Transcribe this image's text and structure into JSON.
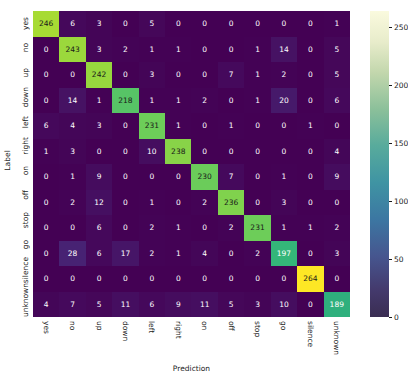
{
  "chart_data": {
    "type": "heatmap",
    "title": "",
    "xlabel": "Prediction",
    "ylabel": "Label",
    "categories": [
      "yes",
      "no",
      "up",
      "down",
      "left",
      "right",
      "on",
      "off",
      "stop",
      "go",
      "silence",
      "unknown"
    ],
    "row_labels": [
      "yes",
      "no",
      "up",
      "down",
      "left",
      "right",
      "on",
      "off",
      "stop",
      "go",
      "silence",
      "unknown"
    ],
    "col_labels": [
      "yes",
      "no",
      "up",
      "down",
      "left",
      "right",
      "on",
      "off",
      "stop",
      "go",
      "silence",
      "unknown"
    ],
    "values": [
      [
        246,
        6,
        3,
        0,
        5,
        0,
        0,
        0,
        0,
        0,
        0,
        1
      ],
      [
        0,
        243,
        3,
        2,
        1,
        1,
        0,
        0,
        1,
        14,
        0,
        5
      ],
      [
        0,
        0,
        242,
        0,
        3,
        0,
        0,
        7,
        1,
        2,
        0,
        5
      ],
      [
        0,
        14,
        1,
        218,
        1,
        1,
        2,
        0,
        1,
        20,
        0,
        6
      ],
      [
        6,
        4,
        3,
        0,
        231,
        1,
        0,
        1,
        0,
        0,
        1,
        0
      ],
      [
        1,
        3,
        0,
        0,
        10,
        238,
        0,
        0,
        0,
        0,
        0,
        4
      ],
      [
        0,
        1,
        9,
        0,
        0,
        0,
        230,
        7,
        0,
        1,
        0,
        9
      ],
      [
        0,
        2,
        12,
        0,
        1,
        0,
        2,
        236,
        0,
        3,
        0,
        0
      ],
      [
        0,
        0,
        6,
        0,
        2,
        1,
        0,
        2,
        231,
        1,
        1,
        2
      ],
      [
        0,
        28,
        6,
        17,
        2,
        1,
        4,
        0,
        2,
        197,
        0,
        3
      ],
      [
        0,
        0,
        0,
        0,
        0,
        0,
        0,
        0,
        0,
        0,
        264,
        0
      ],
      [
        4,
        7,
        5,
        11,
        6,
        9,
        11,
        5,
        3,
        10,
        0,
        189
      ]
    ],
    "colorbar": {
      "ticks": [
        0,
        50,
        100,
        150,
        200,
        250
      ],
      "vmin": 0,
      "vmax": 264,
      "colormap": "viridis",
      "position": "right"
    },
    "grid": false,
    "annotations": "all cells labeled with counts"
  }
}
